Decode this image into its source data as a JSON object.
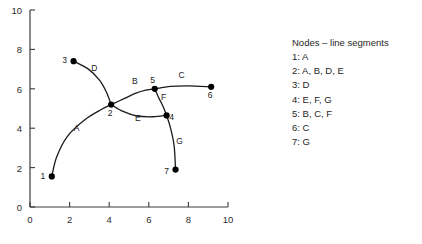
{
  "chart_data": {
    "type": "scatter",
    "title": "",
    "xlabel": "",
    "ylabel": "",
    "xlim": [
      0,
      10
    ],
    "ylim": [
      0,
      10
    ],
    "xticks": [
      "0",
      "2",
      "4",
      "6",
      "8",
      "10"
    ],
    "yticks": [
      "0",
      "2",
      "4",
      "6",
      "8",
      "10"
    ],
    "xtick_values": [
      0,
      2,
      4,
      6,
      8,
      10
    ],
    "ytick_values": [
      0,
      2,
      4,
      6,
      8,
      10
    ],
    "grid": false,
    "legend_position": "right",
    "nodes": [
      {
        "id": "1",
        "x": 1.1,
        "y": 1.55,
        "label": "1",
        "label_dx": -9,
        "label_dy": 3
      },
      {
        "id": "2",
        "x": 4.1,
        "y": 5.2,
        "label": "2",
        "label_dx": -1,
        "label_dy": 11
      },
      {
        "id": "3",
        "x": 2.2,
        "y": 7.4,
        "label": "3",
        "label_dx": -9,
        "label_dy": 2
      },
      {
        "id": "4",
        "x": 6.9,
        "y": 4.65,
        "label": "4",
        "label_dx": 5,
        "label_dy": 5
      },
      {
        "id": "5",
        "x": 6.3,
        "y": 6.0,
        "label": "5",
        "label_dx": -2,
        "label_dy": -6
      },
      {
        "id": "6",
        "x": 9.15,
        "y": 6.1,
        "label": "6",
        "label_dx": -1,
        "label_dy": 11
      },
      {
        "id": "7",
        "x": 7.35,
        "y": 1.9,
        "label": "7",
        "label_dx": -9,
        "label_dy": 4
      }
    ],
    "segments": [
      {
        "id": "A",
        "from": "1",
        "to": "2",
        "label": "A",
        "label_x": 2.35,
        "label_y": 3.85,
        "path": [
          [
            1.1,
            1.55
          ],
          [
            1.35,
            2.55
          ],
          [
            1.9,
            3.6
          ],
          [
            2.8,
            4.45
          ],
          [
            3.6,
            4.95
          ],
          [
            4.1,
            5.2
          ]
        ]
      },
      {
        "id": "B",
        "from": "2",
        "to": "5",
        "label": "B",
        "label_x": 5.3,
        "label_y": 6.25,
        "path": [
          [
            4.1,
            5.2
          ],
          [
            4.75,
            5.5
          ],
          [
            5.35,
            5.78
          ],
          [
            5.85,
            5.93
          ],
          [
            6.3,
            6.0
          ]
        ]
      },
      {
        "id": "C",
        "from": "5",
        "to": "6",
        "label": "C",
        "label_x": 7.65,
        "label_y": 6.55,
        "path": [
          [
            6.3,
            6.0
          ],
          [
            7.1,
            6.12
          ],
          [
            8.0,
            6.15
          ],
          [
            9.15,
            6.1
          ]
        ]
      },
      {
        "id": "D",
        "from": "3",
        "to": "2",
        "label": "D",
        "label_x": 3.25,
        "label_y": 6.9,
        "path": [
          [
            2.2,
            7.4
          ],
          [
            2.95,
            7.0
          ],
          [
            3.5,
            6.45
          ],
          [
            3.85,
            5.85
          ],
          [
            4.1,
            5.2
          ]
        ]
      },
      {
        "id": "E",
        "from": "2",
        "to": "4",
        "label": "E",
        "label_x": 5.45,
        "label_y": 4.35,
        "path": [
          [
            4.1,
            5.2
          ],
          [
            4.7,
            4.85
          ],
          [
            5.4,
            4.62
          ],
          [
            6.2,
            4.58
          ],
          [
            6.9,
            4.65
          ]
        ]
      },
      {
        "id": "F",
        "from": "5",
        "to": "4",
        "label": "F",
        "label_x": 6.75,
        "label_y": 5.45,
        "path": [
          [
            6.3,
            6.0
          ],
          [
            6.5,
            5.55
          ],
          [
            6.72,
            5.1
          ],
          [
            6.9,
            4.65
          ]
        ]
      },
      {
        "id": "G",
        "from": "4",
        "to": "7",
        "label": "G",
        "label_x": 7.55,
        "label_y": 3.2,
        "path": [
          [
            6.9,
            4.65
          ],
          [
            7.1,
            4.0
          ],
          [
            7.28,
            3.1
          ],
          [
            7.35,
            1.9
          ]
        ]
      }
    ]
  },
  "legend": {
    "title": "Nodes – line segments",
    "rows": [
      {
        "node": "1:",
        "segments": "A"
      },
      {
        "node": "2:",
        "segments": "A, B, D, E"
      },
      {
        "node": "3:",
        "segments": "D"
      },
      {
        "node": "4:",
        "segments": "E, F, G"
      },
      {
        "node": "5:",
        "segments": "B, C, F"
      },
      {
        "node": "6:",
        "segments": "C"
      },
      {
        "node": "7:",
        "segments": "G"
      }
    ]
  },
  "colors": {
    "background": "#ffffff",
    "axis": "#3a3a3a",
    "curve": "#1a1a1a",
    "node": "#000000",
    "text": "#262626"
  }
}
